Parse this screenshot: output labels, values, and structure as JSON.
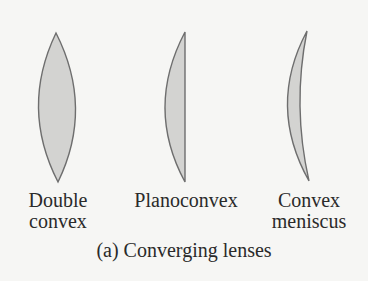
{
  "figure": {
    "caption": "(a) Converging lenses",
    "lens_fill": "#d3d3d1",
    "lens_stroke": "#6e6e6e",
    "lenses": [
      {
        "type": "double-convex",
        "label_line1": "Double",
        "label_line2": "convex"
      },
      {
        "type": "planoconvex",
        "label_line1": "Planoconvex",
        "label_line2": ""
      },
      {
        "type": "convex-meniscus",
        "label_line1": "Convex",
        "label_line2": "meniscus"
      }
    ]
  }
}
